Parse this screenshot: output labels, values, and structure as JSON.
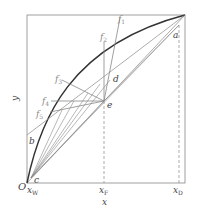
{
  "diagram": {
    "type": "McCabe-Thiele x-y diagram with q-lines",
    "axes": {
      "x_label": "x",
      "y_label": "y",
      "origin_label": "O"
    },
    "x_ticks": [
      {
        "base": "x",
        "sub": "W"
      },
      {
        "base": "x",
        "sub": "F"
      },
      {
        "base": "x",
        "sub": "D"
      }
    ],
    "points": {
      "a": "a",
      "b": "b",
      "c": "c",
      "d": "d",
      "e": "e"
    },
    "q_lines": [
      {
        "base": "f",
        "sub": "1"
      },
      {
        "base": "f",
        "sub": "2"
      },
      {
        "base": "f",
        "sub": "3"
      },
      {
        "base": "f",
        "sub": "4"
      },
      {
        "base": "f",
        "sub": "5"
      }
    ],
    "colors": {
      "curve": "#333333",
      "line": "#777777",
      "frame": "#888888"
    }
  }
}
